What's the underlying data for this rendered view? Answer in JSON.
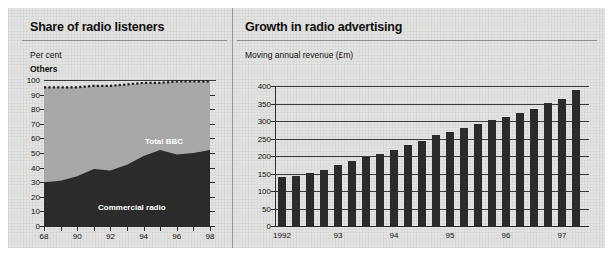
{
  "figure": {
    "background": "#e3e3e1",
    "ink": "#111111"
  },
  "panels": [
    {
      "id": "share-of-radio-listeners",
      "title": "Share of radio listeners",
      "caption": "Per cent",
      "series_top_label": "Others",
      "labels": {
        "bbc": "Total BBC",
        "commercial": "Commercial radio"
      }
    },
    {
      "id": "growth-in-radio-advertising",
      "title": "Growth in radio advertising",
      "caption": "Moving annual revenue (£m)"
    }
  ],
  "chart_data": [
    {
      "type": "area",
      "id": "share-of-radio-listeners",
      "title": "Share of radio listeners",
      "subtitle": "Per cent",
      "xlabel": "",
      "ylabel": "Per cent",
      "ylim": [
        0,
        100
      ],
      "xlim": [
        88,
        98
      ],
      "grid": false,
      "yticks": [
        0,
        10,
        20,
        30,
        40,
        50,
        60,
        70,
        80,
        90,
        100
      ],
      "ytick_labels": [
        "0",
        "10",
        "20",
        "30",
        "40",
        "50",
        "60",
        "70",
        "80",
        "90",
        "100"
      ],
      "xticks": [
        88,
        89,
        90,
        91,
        92,
        93,
        94,
        95,
        96,
        97,
        98
      ],
      "xtick_labels": [
        "68",
        "",
        "90",
        "",
        "92",
        "",
        "94",
        "",
        "96",
        "",
        "98"
      ],
      "x": [
        88,
        89,
        90,
        91,
        92,
        93,
        94,
        95,
        96,
        97,
        98
      ],
      "series": [
        {
          "name": "Commercial radio",
          "color": "#2b2b29",
          "values": [
            30,
            31,
            34,
            39,
            38,
            42,
            48,
            52,
            49,
            50,
            52
          ],
          "annotation": "Commercial radio"
        },
        {
          "name": "Total BBC",
          "color": "#a8a8a6",
          "values": [
            65,
            64,
            62,
            58,
            60,
            56,
            50,
            47,
            50,
            49,
            47
          ],
          "annotation": "Total BBC"
        },
        {
          "name": "Others",
          "color": "#e3e3e1",
          "style": "dotted-boundary",
          "boundary_values": [
            95,
            95,
            95,
            96,
            96,
            97,
            98,
            98,
            99,
            99,
            99
          ],
          "annotation": "Others"
        }
      ],
      "annotations": [
        "Others",
        "Total BBC",
        "Commercial radio"
      ]
    },
    {
      "type": "bar",
      "id": "growth-in-radio-advertising",
      "title": "Growth in radio advertising",
      "subtitle": "Moving annual revenue (£m)",
      "xlabel": "",
      "ylabel": "Moving annual revenue (£m)",
      "ylim": [
        0,
        400
      ],
      "grid": true,
      "bar_color": "#2b2b29",
      "yticks": [
        0,
        50,
        100,
        150,
        200,
        250,
        300,
        350,
        400
      ],
      "ytick_labels": [
        "0",
        "50",
        "100",
        "150",
        "200",
        "250",
        "300",
        "350",
        "400"
      ],
      "xtick_labels": [
        "1992",
        "93",
        "94",
        "95",
        "96",
        "97",
        "98"
      ],
      "xtick_at_bar": [
        0,
        4,
        8,
        12,
        16,
        20,
        24
      ],
      "categories": [
        "1992 Q1",
        "1992 Q2",
        "1992 Q3",
        "1992 Q4",
        "93 Q1",
        "93 Q2",
        "93 Q3",
        "93 Q4",
        "94 Q1",
        "94 Q2",
        "94 Q3",
        "94 Q4",
        "95 Q1",
        "95 Q2",
        "95 Q3",
        "95 Q4",
        "96 Q1",
        "96 Q2",
        "96 Q3",
        "96 Q4",
        "97 Q1",
        "97 Q2",
        "97 Q3",
        "97 Q4",
        "98 Q1",
        "98 Q2"
      ],
      "values": [
        140,
        144,
        152,
        161,
        175,
        186,
        196,
        206,
        216,
        231,
        243,
        259,
        268,
        279,
        291,
        302,
        312,
        323,
        334,
        351,
        362,
        389,
        300,
        300,
        300,
        300
      ]
    }
  ]
}
